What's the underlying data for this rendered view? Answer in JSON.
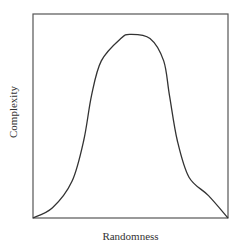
{
  "chart_data": {
    "type": "line",
    "title": "",
    "xlabel": "Randomness",
    "ylabel": "Complexity",
    "xlim": [
      0,
      1
    ],
    "ylim": [
      0,
      1
    ],
    "grid": false,
    "legend": null,
    "ticks": false,
    "series": [
      {
        "name": "complexity",
        "x": [
          0.0,
          0.1,
          0.2,
          0.26,
          0.3,
          0.35,
          0.45,
          0.5,
          0.6,
          0.67,
          0.7,
          0.74,
          0.8,
          0.9,
          1.0
        ],
        "y": [
          0.0,
          0.05,
          0.18,
          0.38,
          0.6,
          0.77,
          0.88,
          0.9,
          0.88,
          0.77,
          0.6,
          0.38,
          0.2,
          0.11,
          0.0
        ]
      }
    ],
    "annotations": [],
    "colors": {
      "line": "#333333",
      "frame": "#555555",
      "background": "#ffffff"
    }
  }
}
